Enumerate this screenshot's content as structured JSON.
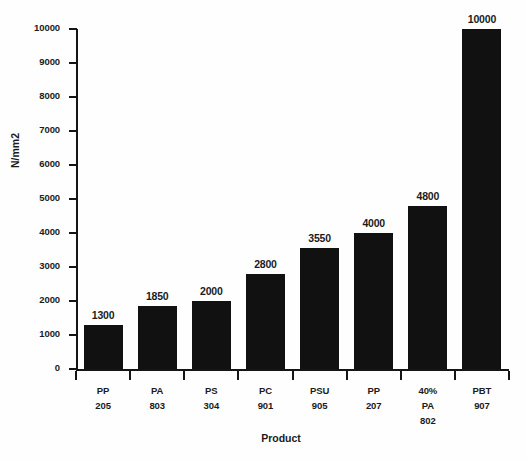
{
  "chart_data": {
    "type": "bar",
    "title": "",
    "xlabel": "Product",
    "ylabel": "N/mm2",
    "ylim": [
      0,
      10000
    ],
    "grid": false,
    "legend": null,
    "orientation": "vertical",
    "bar_color": "#111111",
    "categories": [
      "PP 205",
      "PA 803",
      "PS 304",
      "PC 901",
      "PSU 905",
      "PP 207",
      "40% PA 802",
      "PBT 907"
    ],
    "category_lines": [
      [
        "PP",
        "205"
      ],
      [
        "PA",
        "803"
      ],
      [
        "PS",
        "304"
      ],
      [
        "PC",
        "901"
      ],
      [
        "PSU",
        "905"
      ],
      [
        "PP",
        "207"
      ],
      [
        "40%",
        "PA",
        "802"
      ],
      [
        "PBT",
        "907"
      ]
    ],
    "values": [
      1300,
      1850,
      2000,
      2800,
      3550,
      4000,
      4800,
      10000
    ],
    "value_labels": [
      "1300",
      "1850",
      "2000",
      "2800",
      "3550",
      "4000",
      "4800",
      "10000"
    ],
    "yticks": [
      0,
      1000,
      2000,
      3000,
      4000,
      5000,
      6000,
      7000,
      8000,
      9000,
      10000
    ],
    "ytick_labels": [
      "0",
      "1000",
      "2000",
      "3000",
      "4000",
      "5000",
      "6000",
      "7000",
      "8000",
      "9000",
      "10000"
    ]
  }
}
